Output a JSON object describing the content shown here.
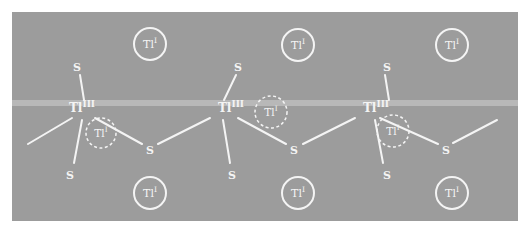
{
  "colors": {
    "background": "#ffffff",
    "panel": "#9c9c9c",
    "band": "#bdbdbd",
    "stroke": "#f4f4f4"
  },
  "panel": {
    "x": 12,
    "y": 12,
    "width": 506,
    "height": 209
  },
  "band": {
    "y": 100,
    "height": 6
  },
  "labels": {
    "tl_iii_base": "Tl",
    "tl_iii_sup": "III",
    "tl_i_base": "Tl",
    "tl_i_sup": "I",
    "sulfur": "S"
  },
  "tl_iii_centers": [
    {
      "id": "tl3-1",
      "x": 82,
      "y": 112
    },
    {
      "id": "tl3-2",
      "x": 231,
      "y": 112
    },
    {
      "id": "tl3-3",
      "x": 376,
      "y": 112
    }
  ],
  "sulfur_atoms": [
    {
      "id": "s-top-1",
      "x": 77,
      "y": 67
    },
    {
      "id": "s-bot-1",
      "x": 70,
      "y": 175
    },
    {
      "id": "s-bridge-1",
      "x": 150,
      "y": 150
    },
    {
      "id": "s-top-2",
      "x": 238,
      "y": 67
    },
    {
      "id": "s-bot-2",
      "x": 232,
      "y": 175
    },
    {
      "id": "s-bridge-2",
      "x": 294,
      "y": 150
    },
    {
      "id": "s-top-3",
      "x": 387,
      "y": 67
    },
    {
      "id": "s-bot-3",
      "x": 387,
      "y": 175
    },
    {
      "id": "s-bridge-3",
      "x": 446,
      "y": 150
    }
  ],
  "bonds": [
    {
      "x1": 28,
      "y1": 144,
      "x2": 72,
      "y2": 118
    },
    {
      "x1": 80,
      "y1": 75,
      "x2": 84,
      "y2": 100
    },
    {
      "x1": 82,
      "y1": 120,
      "x2": 74,
      "y2": 163
    },
    {
      "x1": 95,
      "y1": 118,
      "x2": 142,
      "y2": 144
    },
    {
      "x1": 158,
      "y1": 144,
      "x2": 210,
      "y2": 118
    },
    {
      "x1": 236,
      "y1": 75,
      "x2": 224,
      "y2": 100
    },
    {
      "x1": 223,
      "y1": 120,
      "x2": 230,
      "y2": 163
    },
    {
      "x1": 238,
      "y1": 118,
      "x2": 286,
      "y2": 144
    },
    {
      "x1": 303,
      "y1": 144,
      "x2": 355,
      "y2": 118
    },
    {
      "x1": 385,
      "y1": 75,
      "x2": 389,
      "y2": 100
    },
    {
      "x1": 375,
      "y1": 120,
      "x2": 383,
      "y2": 163
    },
    {
      "x1": 380,
      "y1": 118,
      "x2": 438,
      "y2": 144
    },
    {
      "x1": 453,
      "y1": 143,
      "x2": 497,
      "y2": 120
    }
  ],
  "tl_i_solid": [
    {
      "id": "tl1-top-1",
      "cx": 150,
      "cy": 44,
      "r": 16
    },
    {
      "id": "tl1-top-2",
      "cx": 298,
      "cy": 45,
      "r": 16
    },
    {
      "id": "tl1-top-3",
      "cx": 452,
      "cy": 45,
      "r": 16
    },
    {
      "id": "tl1-bot-1",
      "cx": 150,
      "cy": 193,
      "r": 16
    },
    {
      "id": "tl1-bot-2",
      "cx": 298,
      "cy": 193,
      "r": 16
    },
    {
      "id": "tl1-bot-3",
      "cx": 452,
      "cy": 193,
      "r": 16
    }
  ],
  "tl_i_dashed": [
    {
      "id": "tl1-dash-1",
      "cx": 101,
      "cy": 133,
      "r": 15
    },
    {
      "id": "tl1-dash-2",
      "cx": 271,
      "cy": 112,
      "r": 16
    },
    {
      "id": "tl1-dash-3",
      "cx": 393,
      "cy": 131,
      "r": 16
    }
  ]
}
